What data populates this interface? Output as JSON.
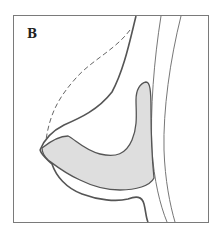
{
  "figure": {
    "panel_label": "B",
    "colors": {
      "frame": "#7a7a7a",
      "outline": "#555555",
      "fill": "#dedede",
      "dashed": "#666666",
      "chest_wall": "#777777"
    }
  }
}
